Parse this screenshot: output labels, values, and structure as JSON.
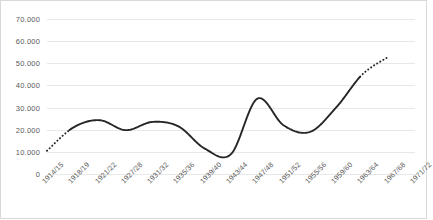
{
  "chart_data": {
    "type": "line",
    "title": "",
    "subtitle": "",
    "xlabel": "",
    "ylabel": "",
    "ylim": [
      0,
      70000
    ],
    "grid": true,
    "legend": "none",
    "y_ticks": [
      "0",
      "10.000",
      "20.000",
      "30.000",
      "40.000",
      "50.000",
      "60.000",
      "70.000"
    ],
    "y_tick_values": [
      0,
      10000,
      20000,
      30000,
      40000,
      50000,
      60000,
      70000
    ],
    "categories": [
      "1914/15",
      "1918/19",
      "1921/22",
      "1927/28",
      "1931/32",
      "1935/36",
      "1939/40",
      "1943/44",
      "1947/48",
      "1951/52",
      "1955/56",
      "1959/60",
      "1963/64",
      "1967/68",
      "1971/72"
    ],
    "series": [
      {
        "name": "series-1",
        "color": "#262626",
        "style": "smoothed-line",
        "values": [
          10500,
          21000,
          24300,
          19800,
          23500,
          21500,
          11500,
          9000,
          34000,
          22000,
          19000,
          30000,
          45000,
          53000,
          null
        ]
      }
    ],
    "annotations": [
      {
        "label": "dotted-extrapolation-start",
        "from": "1914/15",
        "to": "1918/19"
      },
      {
        "label": "dotted-extrapolation-end",
        "from": "1963/64",
        "to": "1967/68"
      }
    ]
  },
  "style": {
    "line_color": "#262626",
    "grid_color": "#e8e8e8",
    "border_color": "#d9d9d9",
    "tick_text_color": "#5a5a5a",
    "background": "#ffffff"
  }
}
